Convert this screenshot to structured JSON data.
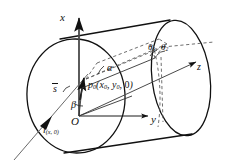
{
  "figure": {
    "type": "line-diagram",
    "background_color": "#ffffff",
    "stroke_color": "#111111",
    "dash_color": "#555555",
    "width": 229,
    "height": 167
  },
  "axes": {
    "x": {
      "label": "x",
      "direction": "up",
      "arrow": true
    },
    "y": {
      "label": "y",
      "direction": "right",
      "arrow": true
    },
    "z": {
      "label": "z",
      "direction": "up-right",
      "arrow": true
    },
    "origin": {
      "label": "O"
    }
  },
  "labels": {
    "point_p0": {
      "name": "p",
      "sub": "0",
      "coords": "(x0, y0, 0)",
      "text": "p0(x0, y0, 0)"
    },
    "vector_s": {
      "text": "s",
      "accent": "overbar-arrow"
    },
    "line_l": {
      "name": "l",
      "sub": "(x, 0)",
      "text": "l(x, 0)"
    },
    "angle_alpha": {
      "text": "α"
    },
    "angle_beta": {
      "text": "β"
    },
    "angle_phi": {
      "text": "ϕ"
    },
    "angle_theta1": {
      "name": "θ",
      "sub": "1",
      "text": "θ1"
    },
    "angle_theta2": {
      "name": "θ",
      "sub": "2",
      "text": "θ2"
    }
  },
  "elements": {
    "cylinder": "right circular cylinder drawn in oblique projection",
    "front_circle": "near end cap ellipse",
    "back_circle": "far end cap ellipse",
    "dashed_construction": "dashed projection lines to cylinder surface"
  }
}
